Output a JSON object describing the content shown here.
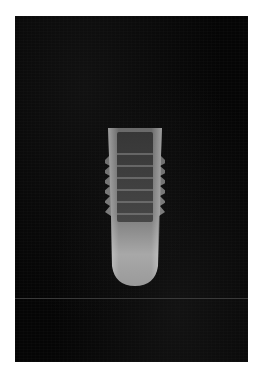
{
  "image": {
    "subject": "dental implant radiograph",
    "description": "X-ray of a threaded dental implant on a dark background",
    "colors": {
      "background": "#ffffff",
      "panel": "#050505",
      "implant_light": "#bdbdbd",
      "implant_dark": "#4a4a4a"
    },
    "thread_count": 7
  },
  "caption": {
    "text": ""
  }
}
